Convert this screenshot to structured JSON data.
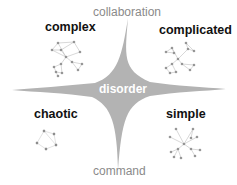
{
  "diagram": {
    "axes": {
      "top": "collaboration",
      "bottom": "command"
    },
    "center": "disorder",
    "quadrants": {
      "top_left": "complex",
      "top_right": "complicated",
      "bottom_left": "chaotic",
      "bottom_right": "simple"
    },
    "colors": {
      "shape": "#b3b3b3",
      "axis_text": "#8a8a8a",
      "label_text": "#111111",
      "node": "#555555",
      "edge": "#bbbbbb"
    }
  }
}
